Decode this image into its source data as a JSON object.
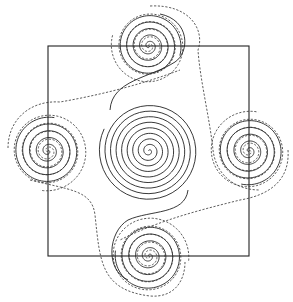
{
  "diagram": {
    "title": "",
    "square": {
      "x1": 48,
      "y1": 46,
      "x2": 249,
      "y2": 256
    },
    "colors": {
      "stroke": "#222222",
      "background": "#ffffff"
    },
    "spirals": [
      {
        "id": "center",
        "cx": 149,
        "cy": 151,
        "style": "solid",
        "turns": 9,
        "outer_radius": 50,
        "direction": 1,
        "start_angle": 3.6
      },
      {
        "id": "top",
        "cx": 149,
        "cy": 46,
        "style": "mixed",
        "turns": 5,
        "outer_radius": 38,
        "direction": 1,
        "start_angle": 0.3
      },
      {
        "id": "left",
        "cx": 48,
        "cy": 151,
        "style": "mixed",
        "turns": 5,
        "outer_radius": 40,
        "direction": 1,
        "start_angle": 4.9
      },
      {
        "id": "right",
        "cx": 249,
        "cy": 151,
        "style": "mixed",
        "turns": 5,
        "outer_radius": 40,
        "direction": 1,
        "start_angle": 1.8
      },
      {
        "id": "bottom",
        "cx": 149,
        "cy": 256,
        "style": "mixed",
        "turns": 5,
        "outer_radius": 40,
        "direction": 1,
        "start_angle": 3.3
      }
    ],
    "connectors": [
      {
        "id": "center-to-top-solid",
        "style": "solid",
        "d": "M 110 110 C 112 80, 150 78, 175 62 C 190 52, 190 20, 160 14"
      },
      {
        "id": "center-to-bottom-solid",
        "style": "solid",
        "d": "M 188 190 C 185 215, 150 210, 128 220 C 108 232, 105 270, 128 280"
      },
      {
        "id": "top-to-right-dashed",
        "style": "dashed",
        "d": "M 150 6 C 190 4, 205 30, 198 50 C 200 80, 210 120, 213 150 C 216 175, 235 190, 260 190"
      },
      {
        "id": "left-to-top-dashed",
        "style": "dashed",
        "d": "M 8 148 C 8 120, 30 100, 60 102 C 100 95, 140 85, 180 70"
      },
      {
        "id": "right-to-bottom-dashed",
        "style": "dashed",
        "d": "M 288 150 C 290 180, 270 195, 240 200 C 200 210, 160 220, 120 240"
      },
      {
        "id": "left-to-bottom-dashed",
        "style": "dashed",
        "d": "M 30 180 C 70 190, 92 190, 95 215 C 100 260, 100 290, 150 296 C 175 298, 185 280, 185 262"
      }
    ]
  }
}
